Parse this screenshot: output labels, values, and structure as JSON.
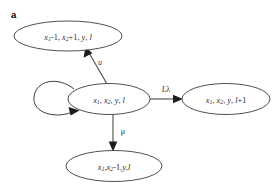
{
  "figure": {
    "panel_label": "a",
    "background_color": "#ffffff",
    "stroke_color": "#3c3c3c",
    "text_color": "#2a2a2a",
    "width": 280,
    "height": 189
  },
  "nodes": [
    {
      "id": "state-up",
      "name": "state-node-x1-minus-1-x2-plus-1",
      "label": "x₁-1, x₂+1, y, l",
      "parts": [
        {
          "text": "x",
          "style": "italic"
        },
        {
          "text": "1",
          "style": "sub"
        },
        {
          "text": "-1, ",
          "style": "roman"
        },
        {
          "text": "x",
          "style": "italic"
        },
        {
          "text": "2",
          "style": "sub"
        },
        {
          "text": "+1, ",
          "style": "roman"
        },
        {
          "text": "y",
          "style": "italic"
        },
        {
          "text": ", ",
          "style": "roman"
        },
        {
          "text": "l",
          "style": "italic"
        }
      ],
      "cx": 68,
      "cy": 36,
      "rx": 54,
      "ry": 15
    },
    {
      "id": "state-center",
      "name": "state-node-current",
      "label": "x₁, x₂, y, l",
      "parts": [
        {
          "text": "x",
          "style": "italic"
        },
        {
          "text": "1",
          "style": "sub"
        },
        {
          "text": ", ",
          "style": "roman"
        },
        {
          "text": "x",
          "style": "italic"
        },
        {
          "text": "2",
          "style": "sub"
        },
        {
          "text": ", ",
          "style": "roman"
        },
        {
          "text": "y",
          "style": "italic"
        },
        {
          "text": ", ",
          "style": "roman"
        },
        {
          "text": "l",
          "style": "italic"
        }
      ],
      "cx": 109,
      "cy": 99,
      "rx": 41,
      "ry": 15.5
    },
    {
      "id": "state-right",
      "name": "state-node-l-plus-1",
      "label": "x₁, x₂, y, l+1",
      "parts": [
        {
          "text": "x",
          "style": "italic"
        },
        {
          "text": "1",
          "style": "sub"
        },
        {
          "text": ", ",
          "style": "roman"
        },
        {
          "text": "x",
          "style": "italic"
        },
        {
          "text": "2",
          "style": "sub"
        },
        {
          "text": ", ",
          "style": "roman"
        },
        {
          "text": "y",
          "style": "italic"
        },
        {
          "text": ", ",
          "style": "roman"
        },
        {
          "text": "l",
          "style": "italic"
        },
        {
          "text": "+1",
          "style": "roman"
        }
      ],
      "cx": 226,
      "cy": 99,
      "rx": 44,
      "ry": 15.5
    },
    {
      "id": "state-down",
      "name": "state-node-x2-minus-1",
      "label": "x₁,x₂-1,y,l",
      "parts": [
        {
          "text": "x",
          "style": "italic"
        },
        {
          "text": "1",
          "style": "sub"
        },
        {
          "text": ",",
          "style": "roman"
        },
        {
          "text": "x",
          "style": "italic"
        },
        {
          "text": "2",
          "style": "sub"
        },
        {
          "text": "-1,",
          "style": "roman"
        },
        {
          "text": "y",
          "style": "italic"
        },
        {
          "text": ",",
          "style": "roman"
        },
        {
          "text": "l",
          "style": "italic"
        }
      ],
      "cx": 114,
      "cy": 166,
      "rx": 48,
      "ry": 15.5
    }
  ],
  "edges": [
    {
      "id": "edge-u",
      "name": "transition-arrow-u",
      "label": "u",
      "label_x": 100,
      "label_y": 62,
      "from": "state-center",
      "to": "state-up"
    },
    {
      "id": "edge-l-lambda",
      "name": "transition-arrow-l-lambda",
      "label": "Lλ",
      "label_x": 166,
      "label_y": 89,
      "from": "state-center",
      "to": "state-right"
    },
    {
      "id": "edge-mu",
      "name": "transition-arrow-mu",
      "label": "μ",
      "label_x": 123,
      "label_y": 131,
      "from": "state-center",
      "to": "state-down"
    },
    {
      "id": "edge-self-loop",
      "name": "self-loop-arrow",
      "label": "",
      "from": "state-center",
      "to": "state-center"
    }
  ]
}
